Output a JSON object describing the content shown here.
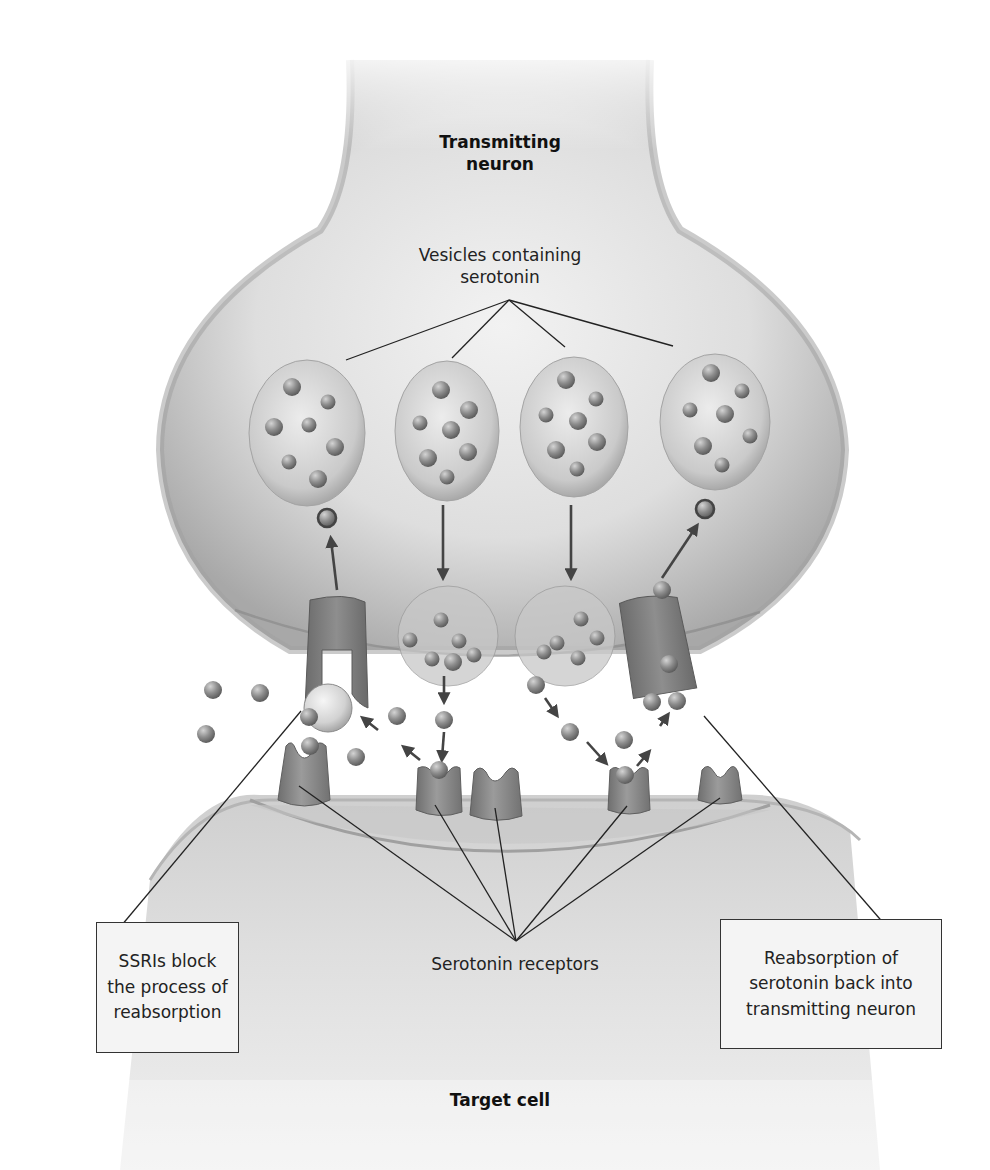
{
  "diagram": {
    "labels": {
      "transmitting_neuron_line1": "Transmitting",
      "transmitting_neuron_line2": "neuron",
      "vesicles_line1": "Vesicles containing",
      "vesicles_line2": "serotonin",
      "serotonin_receptors": "Serotonin receptors",
      "target_cell": "Target cell"
    },
    "callouts": {
      "ssri_box": {
        "line1": "SSRIs block",
        "line2": "the process of",
        "line3": "reabsorption"
      },
      "reabsorption_box": {
        "line1": "Reabsorption of",
        "line2": "serotonin back into",
        "line3": "transmitting neuron"
      }
    },
    "components": {
      "vesicles_in_neuron": 4,
      "fusing_vesicles": 2,
      "reuptake_transporters": 2,
      "receptors_on_target_cell": 5,
      "ssri_blocker": 1
    },
    "colors": {
      "neuron_fill": "#d8d8d8",
      "neuron_edge": "#9a9a9a",
      "vesicle_fill": "#c9c9c9",
      "serotonin_molecule": "#8a8a8a",
      "transporter": "#7d7d7d",
      "receptor": "#8c8c8c",
      "target_cell_fill": "#d6d6d6",
      "leader_line": "#222222",
      "arrow": "#444444",
      "callout_bg": "#f4f4f4"
    }
  }
}
